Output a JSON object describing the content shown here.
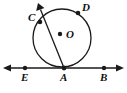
{
  "figure": {
    "kind": "geometry-diagram",
    "width": 127,
    "height": 93,
    "background_color": "#ffffff",
    "stroke_color": "#1a1a1a",
    "label_color": "#111111"
  },
  "circle": {
    "name": "circle-O",
    "center_label": "O",
    "center_x": 62,
    "center_y": 38,
    "radius": 29,
    "center_dot_x": 60,
    "center_dot_y": 34,
    "center_label_x": 66,
    "center_label_y": 29
  },
  "tangent_line": {
    "name": "line-EAB",
    "y": 68,
    "x_start": 4,
    "x_end": 123,
    "arrow_left": true,
    "arrow_right": true
  },
  "secant_ray": {
    "name": "ray-AC",
    "from_x": 64,
    "from_y": 68,
    "to_x": 38,
    "to_y": 3,
    "arrow_at_end": true
  },
  "points": [
    {
      "label": "C",
      "name": "point-c",
      "dot_x": 40,
      "dot_y": 22,
      "label_x": 28,
      "label_y": 12
    },
    {
      "label": "D",
      "name": "point-d",
      "dot_x": 78,
      "dot_y": 13,
      "label_x": 82,
      "label_y": 2
    },
    {
      "label": "E",
      "name": "point-e",
      "dot_x": 25,
      "dot_y": 68,
      "label_x": 21,
      "label_y": 72
    },
    {
      "label": "A",
      "name": "point-a",
      "dot_x": 64,
      "dot_y": 68,
      "label_x": 60,
      "label_y": 72
    },
    {
      "label": "B",
      "name": "point-b",
      "dot_x": 104,
      "dot_y": 68,
      "label_x": 100,
      "label_y": 72
    }
  ]
}
